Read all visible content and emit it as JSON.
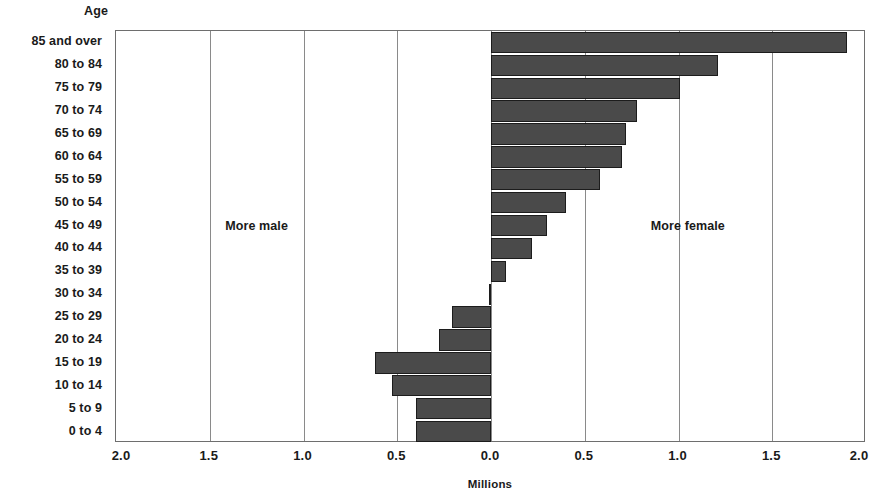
{
  "axis": {
    "y_title": "Age",
    "x_title": "Millions",
    "x_ticks": [
      "2.0",
      "1.5",
      "1.0",
      "0.5",
      "0.0",
      "0.5",
      "1.0",
      "1.5",
      "2.0"
    ]
  },
  "annotations": {
    "left_label": "More male",
    "right_label": "More female"
  },
  "colors": {
    "bar_fill": "#4a4a4a",
    "bar_stroke": "#1c1c1c",
    "grid": "#8a8a8a",
    "frame": "#6e6e6e",
    "text": "#1a1a1a"
  },
  "chart_data": {
    "type": "bar",
    "orientation": "horizontal",
    "title": "",
    "subtitle": "",
    "xlabel": "Millions",
    "ylabel": "Age",
    "xlim": [
      -2.0,
      2.0
    ],
    "xticks": [
      -2.0,
      -1.5,
      -1.0,
      -0.5,
      0.0,
      0.5,
      1.0,
      1.5,
      2.0
    ],
    "xticklabels": [
      "2.0",
      "1.5",
      "1.0",
      "0.5",
      "0.0",
      "0.5",
      "1.0",
      "1.5",
      "2.0"
    ],
    "grid": true,
    "legend": null,
    "annotations": [
      {
        "text": "More male",
        "x": -1.25,
        "y": "45 to 49"
      },
      {
        "text": "More female",
        "x": 1.05,
        "y": "45 to 49"
      }
    ],
    "note": "Negative values indicate more male; positive values indicate more female.",
    "categories": [
      "85 and over",
      "80 to 84",
      "75 to 79",
      "70 to 74",
      "65 to 69",
      "60 to 64",
      "55 to 59",
      "50 to 54",
      "45 to 49",
      "40 to 44",
      "35 to 39",
      "30 to 34",
      "25 to 29",
      "20 to 24",
      "15 to 19",
      "10 to 14",
      "5 to 9",
      "0 to 4"
    ],
    "values": [
      1.9,
      1.21,
      1.01,
      0.78,
      0.72,
      0.7,
      0.58,
      0.4,
      0.3,
      0.22,
      0.08,
      -0.01,
      -0.21,
      -0.28,
      -0.62,
      -0.53,
      -0.4,
      -0.4
    ]
  }
}
